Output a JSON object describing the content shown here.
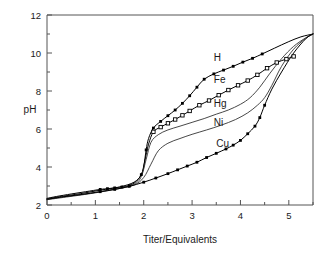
{
  "chart_data": {
    "type": "line",
    "title": "",
    "xlabel": "Titer/Equivalents",
    "ylabel": "pH",
    "xlim": [
      0,
      5.5
    ],
    "ylim": [
      2,
      12
    ],
    "grid": false,
    "legend_position": "inline-labels",
    "xticks": [
      0,
      1,
      2,
      3,
      4,
      5
    ],
    "xtick_labels": [
      "0",
      "1",
      "2",
      "3",
      "4",
      "5"
    ],
    "xminor_ticks": [
      0.5,
      1.5,
      2.5,
      3.5,
      4.5,
      5.5
    ],
    "yticks": [
      2,
      4,
      6,
      8,
      10,
      12
    ],
    "ytick_labels": [
      "2",
      "4",
      "6",
      "8",
      "10",
      "12"
    ],
    "yminor_ticks": [
      3,
      5,
      7,
      9,
      11
    ],
    "series": [
      {
        "name": "H",
        "label": "H",
        "marker": "filled-square",
        "label_x": 3.45,
        "label_y": 9.75,
        "x": [
          0,
          0.2,
          0.5,
          0.8,
          1.1,
          1.25,
          1.4,
          1.55,
          1.7,
          1.85,
          1.95,
          2.0,
          2.05,
          2.1,
          2.2,
          2.35,
          2.5,
          2.65,
          2.8,
          2.95,
          3.1,
          3.25,
          3.45,
          3.65,
          3.85,
          4.05,
          4.25,
          4.45,
          4.7,
          5.0,
          5.25,
          5.5
        ],
        "y": [
          2.35,
          2.45,
          2.58,
          2.7,
          2.82,
          2.86,
          2.9,
          2.95,
          3.02,
          3.25,
          3.6,
          4.0,
          4.9,
          5.5,
          6.05,
          6.4,
          6.7,
          7.0,
          7.35,
          7.75,
          8.2,
          8.62,
          8.9,
          9.1,
          9.3,
          9.52,
          9.72,
          9.95,
          10.25,
          10.6,
          10.85,
          11.0
        ],
        "marker_x": [
          1.1,
          1.25,
          1.4,
          1.55,
          1.7,
          1.95,
          2.05,
          2.2,
          2.35,
          2.5,
          2.65,
          2.8,
          2.95,
          3.1,
          3.25,
          3.45,
          3.65,
          3.85,
          4.05,
          4.25,
          4.45
        ],
        "marker_y": [
          2.82,
          2.86,
          2.9,
          2.95,
          3.02,
          3.6,
          4.9,
          6.05,
          6.4,
          6.7,
          7.0,
          7.35,
          7.75,
          8.2,
          8.62,
          8.9,
          9.1,
          9.3,
          9.52,
          9.72,
          9.95
        ]
      },
      {
        "name": "Fe",
        "label": "Fe",
        "marker": "open-square",
        "label_x": 3.45,
        "label_y": 8.6,
        "x": [
          0,
          0.3,
          0.7,
          1.1,
          1.5,
          1.8,
          1.95,
          2.02,
          2.1,
          2.2,
          2.35,
          2.5,
          2.65,
          2.8,
          2.95,
          3.15,
          3.35,
          3.55,
          3.75,
          3.95,
          4.15,
          4.35,
          4.55,
          4.75,
          4.95,
          5.1
        ],
        "y": [
          2.32,
          2.45,
          2.6,
          2.78,
          2.95,
          3.2,
          3.6,
          4.3,
          5.2,
          5.85,
          6.1,
          6.3,
          6.5,
          6.72,
          6.95,
          7.25,
          7.5,
          7.78,
          8.05,
          8.3,
          8.55,
          8.85,
          9.2,
          9.5,
          9.68,
          9.82
        ],
        "marker_x": [
          2.2,
          2.35,
          2.5,
          2.65,
          2.8,
          2.95,
          3.15,
          3.35,
          3.55,
          3.75,
          3.95,
          4.15,
          4.35,
          4.55,
          4.75,
          4.95,
          5.1
        ],
        "marker_y": [
          5.85,
          6.1,
          6.3,
          6.5,
          6.72,
          6.95,
          7.25,
          7.5,
          7.78,
          8.05,
          8.3,
          8.55,
          8.85,
          9.2,
          9.5,
          9.68,
          9.82
        ]
      },
      {
        "name": "Hg",
        "label": "Hg",
        "marker": "none",
        "label_x": 3.45,
        "label_y": 7.35,
        "x": [
          0,
          0.4,
          0.9,
          1.4,
          1.8,
          1.95,
          2.05,
          2.15,
          2.3,
          2.5,
          2.75,
          3.0,
          3.25,
          3.5,
          3.75,
          4.0,
          4.2,
          4.4,
          4.6,
          4.85,
          5.1,
          5.35,
          5.5
        ],
        "y": [
          2.3,
          2.45,
          2.62,
          2.85,
          3.1,
          3.5,
          4.4,
          5.3,
          5.7,
          5.95,
          6.15,
          6.35,
          6.55,
          6.78,
          7.0,
          7.3,
          7.65,
          8.2,
          8.9,
          9.7,
          10.35,
          10.8,
          11.0
        ]
      },
      {
        "name": "Ni",
        "label": "Ni",
        "marker": "none",
        "label_x": 3.45,
        "label_y": 6.35,
        "x": [
          0,
          0.4,
          0.9,
          1.4,
          1.8,
          2.0,
          2.15,
          2.3,
          2.5,
          2.75,
          3.0,
          3.3,
          3.6,
          3.9,
          4.15,
          4.35,
          4.5,
          4.65,
          4.85,
          5.1,
          5.35,
          5.5
        ],
        "y": [
          2.28,
          2.42,
          2.6,
          2.82,
          3.05,
          3.45,
          4.15,
          4.85,
          5.25,
          5.5,
          5.72,
          5.95,
          6.2,
          6.5,
          6.85,
          7.25,
          7.65,
          8.3,
          9.3,
          10.2,
          10.78,
          11.0
        ]
      },
      {
        "name": "Cu",
        "label": "Cu",
        "marker": "filled-square",
        "label_x": 3.5,
        "label_y": 5.25,
        "x": [
          0,
          0.3,
          0.7,
          1.1,
          1.4,
          1.7,
          2.0,
          2.25,
          2.5,
          2.7,
          2.9,
          3.1,
          3.3,
          3.5,
          3.7,
          3.85,
          4.0,
          4.15,
          4.3,
          4.4,
          4.5,
          4.65,
          4.85,
          5.1,
          5.35,
          5.5
        ],
        "y": [
          2.3,
          2.42,
          2.55,
          2.7,
          2.82,
          2.98,
          3.2,
          3.42,
          3.65,
          3.85,
          4.05,
          4.25,
          4.5,
          4.72,
          4.95,
          5.15,
          5.4,
          5.75,
          6.15,
          6.6,
          7.25,
          8.1,
          9.0,
          10.0,
          10.75,
          11.0
        ],
        "marker_x": [
          1.1,
          1.4,
          1.7,
          2.0,
          2.25,
          2.5,
          2.7,
          2.9,
          3.1,
          3.3,
          3.5,
          3.7,
          3.85,
          4.0,
          4.15,
          4.3,
          4.4,
          4.5
        ],
        "marker_y": [
          2.7,
          2.82,
          2.98,
          3.2,
          3.42,
          3.65,
          3.85,
          4.05,
          4.25,
          4.5,
          4.72,
          4.95,
          5.15,
          5.4,
          5.75,
          6.15,
          6.6,
          7.25
        ]
      }
    ]
  },
  "colors": {
    "background": "#ffffff",
    "axis": "#555555",
    "curve": "#000000",
    "text": "#1a1a1a"
  }
}
